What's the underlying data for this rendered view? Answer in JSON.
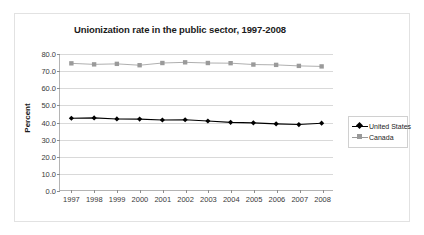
{
  "chart_data": {
    "type": "line",
    "title": "Unionization rate in the public sector, 1997-2008",
    "xlabel": "",
    "ylabel": "Percent",
    "categories": [
      "1997",
      "1998",
      "1999",
      "2000",
      "2001",
      "2002",
      "2003",
      "2004",
      "2005",
      "2006",
      "2007",
      "2008"
    ],
    "ylim": [
      0.0,
      80.0
    ],
    "ytick_labels": [
      "0.0",
      "10.0",
      "20.0",
      "30.0",
      "40.0",
      "50.0",
      "60.0",
      "70.0",
      "80.0"
    ],
    "ytick_values": [
      0.0,
      10.0,
      20.0,
      30.0,
      40.0,
      50.0,
      60.0,
      70.0,
      80.0
    ],
    "grid": true,
    "legend_position": "right",
    "series": [
      {
        "name": "United States",
        "color": "#000000",
        "marker": "diamond",
        "values": [
          42.2,
          42.4,
          41.8,
          41.7,
          41.2,
          41.3,
          40.6,
          39.8,
          39.5,
          38.9,
          38.5,
          39.3
        ]
      },
      {
        "name": "Canada",
        "color": "#9a9a9a",
        "marker": "square",
        "values": [
          74.5,
          73.9,
          74.2,
          73.4,
          74.7,
          75.1,
          74.7,
          74.6,
          73.8,
          73.6,
          73.0,
          72.7
        ]
      }
    ]
  }
}
